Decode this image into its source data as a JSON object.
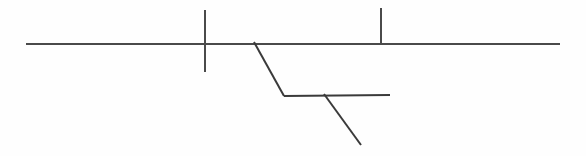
{
  "figure": {
    "kind": "line-drawing",
    "width": 586,
    "height": 156,
    "background_color": "#fefefe",
    "stroke_color": "#4a4a4a",
    "stroke_color_dark": "#3a3a3a",
    "stroke_width": 2,
    "label_text": ""
  },
  "chart_data": {
    "type": "line",
    "subtitle": "",
    "xlabel": "",
    "ylabel": "",
    "xlim": [
      0,
      586
    ],
    "ylim": [
      0,
      156
    ],
    "grid": false,
    "legend": false,
    "units": "pixels",
    "annotations": [],
    "series": [
      {
        "name": "main-horizon",
        "role": "primary horizontal bedding line",
        "stroke": "#4a4a4a",
        "width": 2,
        "points": [
          [
            26,
            44
          ],
          [
            560,
            44
          ]
        ]
      },
      {
        "name": "tick-left",
        "role": "vertical marker crossing the horizon",
        "stroke": "#4a4a4a",
        "width": 2,
        "points": [
          [
            205,
            10
          ],
          [
            205,
            72
          ]
        ]
      },
      {
        "name": "tick-right",
        "role": "vertical marker above the horizon",
        "stroke": "#4a4a4a",
        "width": 2,
        "points": [
          [
            381,
            8
          ],
          [
            381,
            43
          ]
        ]
      },
      {
        "name": "fault-upper",
        "role": "upper inclined fault segment",
        "stroke": "#3a3a3a",
        "width": 2,
        "points": [
          [
            254,
            42
          ],
          [
            284,
            96
          ]
        ]
      },
      {
        "name": "offset-horizon",
        "role": "lower displaced horizontal bedding line",
        "stroke": "#3a3a3a",
        "width": 2,
        "points": [
          [
            284,
            96
          ],
          [
            390,
            95
          ]
        ]
      },
      {
        "name": "fault-lower",
        "role": "lower inclined fault segment",
        "stroke": "#3a3a3a",
        "width": 2,
        "points": [
          [
            324,
            94
          ],
          [
            361,
            145
          ]
        ]
      }
    ]
  }
}
